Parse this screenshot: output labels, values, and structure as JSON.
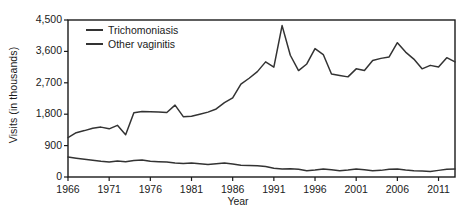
{
  "chart_data": {
    "type": "line",
    "title": "",
    "xlabel": "Year",
    "ylabel": "Visits (in thousands)",
    "xlim": [
      1966,
      2013
    ],
    "ylim": [
      0,
      4500
    ],
    "grid": false,
    "legend_position": "top-left",
    "yticks": [
      0,
      900,
      1800,
      2700,
      3600,
      4500
    ],
    "ytick_labels": [
      "0",
      "900",
      "1,800",
      "2,700",
      "3,600",
      "4,500"
    ],
    "xticks": [
      1966,
      1971,
      1976,
      1981,
      1986,
      1991,
      1996,
      2001,
      2006,
      2011
    ],
    "xtick_labels": [
      "1966",
      "1971",
      "1976",
      "1981",
      "1986",
      "1991",
      "1996",
      "2001",
      "2006",
      "2011"
    ],
    "x": [
      1966,
      1967,
      1968,
      1969,
      1970,
      1971,
      1972,
      1973,
      1974,
      1975,
      1976,
      1977,
      1978,
      1979,
      1980,
      1981,
      1982,
      1983,
      1984,
      1985,
      1986,
      1987,
      1988,
      1989,
      1990,
      1991,
      1992,
      1993,
      1994,
      1995,
      1996,
      1997,
      1998,
      1999,
      2000,
      2001,
      2002,
      2003,
      2004,
      2005,
      2006,
      2007,
      2008,
      2009,
      2010,
      2011,
      2012,
      2013
    ],
    "series": [
      {
        "name": "Trichomoniasis",
        "color": "#333333",
        "values": [
          570,
          540,
          510,
          480,
          450,
          430,
          460,
          440,
          470,
          490,
          450,
          440,
          430,
          400,
          390,
          400,
          380,
          360,
          380,
          400,
          370,
          340,
          330,
          320,
          300,
          250,
          230,
          240,
          220,
          180,
          200,
          230,
          210,
          180,
          200,
          230,
          210,
          180,
          190,
          220,
          230,
          200,
          180,
          170,
          160,
          190,
          220,
          230
        ]
      },
      {
        "name": "Other vaginitis",
        "color": "#333333",
        "values": [
          1130,
          1270,
          1330,
          1400,
          1430,
          1380,
          1480,
          1210,
          1840,
          1880,
          1870,
          1860,
          1850,
          2060,
          1730,
          1740,
          1800,
          1860,
          1950,
          2130,
          2270,
          2660,
          2830,
          3020,
          3300,
          3150,
          4340,
          3490,
          3050,
          3240,
          3680,
          3510,
          2950,
          2910,
          2870,
          3100,
          3050,
          3340,
          3400,
          3440,
          3850,
          3580,
          3380,
          3100,
          3200,
          3150,
          3420,
          3300
        ]
      }
    ]
  },
  "legend": {
    "items": [
      {
        "label": "Trichomoniasis"
      },
      {
        "label": "Other vaginitis"
      }
    ]
  }
}
